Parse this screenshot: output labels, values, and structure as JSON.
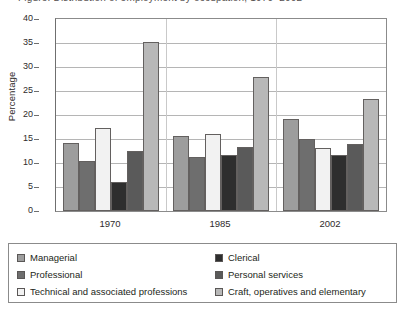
{
  "title": {
    "text": "Figure: Distribution of employment by occupation, 1970–2002",
    "cropped": true
  },
  "chart_data": {
    "type": "bar",
    "title": "",
    "xlabel": "",
    "ylabel": "Percentage",
    "ylim": [
      0,
      40
    ],
    "ytick_step": 5,
    "yticks": [
      40,
      35,
      30,
      25,
      20,
      15,
      10,
      5,
      0
    ],
    "grid": true,
    "grid_axis": "y",
    "legend_position": "bottom",
    "categories": [
      "1970",
      "1985",
      "2002"
    ],
    "series": [
      {
        "name": "Managerial",
        "color": "#9d9d9d",
        "values": [
          14.2,
          15.7,
          19.2
        ]
      },
      {
        "name": "Professional",
        "color": "#6e6e6e",
        "values": [
          10.5,
          11.3,
          15.0
        ]
      },
      {
        "name": "Technical and associated professions",
        "color": "#f2f2f2",
        "values": [
          17.3,
          16.1,
          13.1
        ]
      },
      {
        "name": "Clerical",
        "color": "#2e2e2e",
        "values": [
          6.1,
          11.7,
          11.7
        ]
      },
      {
        "name": "Personal services",
        "color": "#5a5a5a",
        "values": [
          12.4,
          13.4,
          13.9
        ]
      },
      {
        "name": "Craft, operatives and elementary",
        "color": "#b8b8b8",
        "values": [
          35.2,
          27.9,
          23.4
        ]
      }
    ]
  },
  "legend": {
    "left_items": [
      "Managerial",
      "Professional",
      "Technical and associated professions"
    ],
    "right_items": [
      "Clerical",
      "Personal services",
      "Craft, operatives and elementary"
    ]
  }
}
